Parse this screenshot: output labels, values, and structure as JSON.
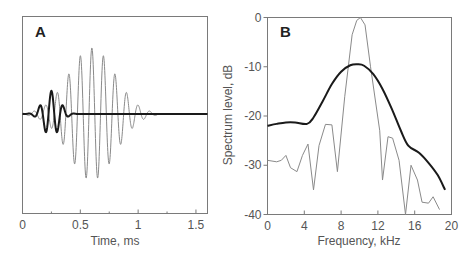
{
  "chart_data": [
    {
      "panel": "A",
      "type": "line",
      "title": "",
      "xlabel": "Time, ms",
      "ylabel": "",
      "xlim": [
        0,
        1.6
      ],
      "xticks": [
        0,
        0.5,
        1,
        1.5
      ],
      "xtick_labels": [
        "0",
        "0.5",
        "1",
        "1.5"
      ],
      "minor_xticks": [
        0.25,
        0.75,
        1.25
      ],
      "grid": false,
      "series": [
        {
          "name": "long tone burst (thin)",
          "style": "thin gray",
          "description": "Gaussian-windowed 10 kHz sinusoid, ~0.05–1.15 ms, peak amplitude near 0.6 ms",
          "carrier_khz": 10,
          "center_ms": 0.6,
          "envelope_sigma_ms": 0.2,
          "relative_amplitude": 1.0
        },
        {
          "name": "short pulse (thick)",
          "style": "thick black",
          "description": "Short ~10 kHz pulse, ~0.05–0.45 ms, peak near 0.26 ms; flat baseline afterwards",
          "carrier_khz": 10,
          "center_ms": 0.25,
          "envelope_sigma_ms": 0.07,
          "relative_amplitude": 0.35
        }
      ]
    },
    {
      "panel": "B",
      "type": "line",
      "title": "",
      "xlabel": "Frequency, kHz",
      "ylabel": "Spectrum level, dB",
      "xlim": [
        0,
        20
      ],
      "ylim": [
        -40,
        0
      ],
      "xticks": [
        0,
        4,
        8,
        12,
        16,
        20
      ],
      "yticks": [
        0,
        -10,
        -20,
        -30,
        -40
      ],
      "grid": false,
      "series": [
        {
          "name": "long tone burst spectrum (thin)",
          "style": "thin gray",
          "x": [
            0,
            1,
            1.5,
            2,
            2.5,
            3.2,
            3.8,
            4.4,
            5,
            5.6,
            6.3,
            7,
            7.6,
            8.4,
            9.2,
            9.7,
            10.1,
            10.6,
            11.2,
            12.2,
            12.5,
            13.1,
            13.6,
            14.3,
            15,
            15.6,
            16.3,
            16.8,
            17.5,
            18,
            18.7
          ],
          "y": [
            -29,
            -29.3,
            -29,
            -28,
            -30.5,
            -31.3,
            -28,
            -25.7,
            -35,
            -26,
            -21.7,
            -21.8,
            -31.3,
            -16,
            -3.5,
            -0.6,
            0,
            -1.5,
            -10,
            -23,
            -33,
            -24.2,
            -24.5,
            -29,
            -40,
            -30,
            -33,
            -37.5,
            -37.7,
            -36.4,
            -39
          ]
        },
        {
          "name": "short pulse spectrum (thick)",
          "style": "thick black",
          "x": [
            0,
            1,
            2,
            3,
            4.3,
            5,
            6,
            7,
            8,
            9,
            9.8,
            10.5,
            11.5,
            12.5,
            13.5,
            14.5,
            15.3,
            16.5,
            17.5,
            18.5,
            19.3
          ],
          "y": [
            -22,
            -21.6,
            -21.3,
            -21.3,
            -21.6,
            -20.3,
            -17,
            -13.5,
            -11,
            -9.7,
            -9.5,
            -9.8,
            -11.5,
            -14.5,
            -18.5,
            -23,
            -26,
            -27.5,
            -29.5,
            -32,
            -35
          ]
        }
      ]
    }
  ],
  "panelA": {
    "label": "A",
    "xlabel": "Time, ms",
    "xticks": [
      "0",
      "0.5",
      "1",
      "1.5"
    ]
  },
  "panelB": {
    "label": "B",
    "xlabel": "Frequency, kHz",
    "ylabel": "Spectrum level, dB",
    "xticks": [
      "0",
      "4",
      "8",
      "12",
      "16",
      "20"
    ],
    "yticks": [
      "0",
      "-10",
      "-20",
      "-30",
      "-40"
    ]
  },
  "colors": {
    "thin_line": "#8a8a8a",
    "thick_line": "#1a1a1a",
    "axis": "#7a7a7a",
    "text": "#555555"
  }
}
